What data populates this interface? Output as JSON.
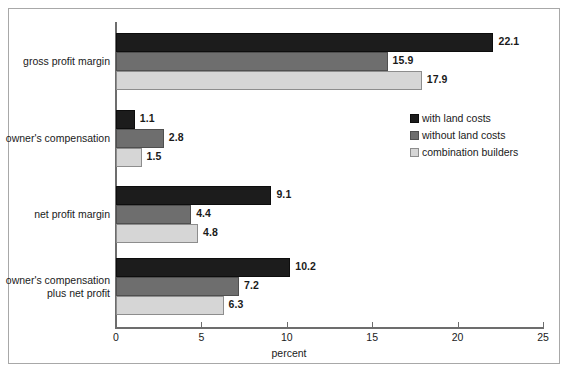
{
  "chart_data": {
    "type": "bar",
    "orientation": "horizontal",
    "title": "",
    "xlabel": "percent",
    "ylabel": "",
    "xlim": [
      0,
      25
    ],
    "xticks": [
      0,
      5,
      10,
      15,
      20,
      25
    ],
    "xtick_labels": [
      "0",
      "5",
      "10",
      "15",
      "20",
      "25"
    ],
    "grid": false,
    "legend_position": "inside-upper-right",
    "categories": [
      "gross profit margin",
      "owner's compensation",
      "net profit margin",
      "owner's compensation\nplus net profit"
    ],
    "series": [
      {
        "name": "with land costs",
        "color": "#1c1c1c",
        "values": [
          22.1,
          1.1,
          9.1,
          10.2
        ],
        "labels": [
          "22.1",
          "1.1",
          "9.1",
          "10.2"
        ]
      },
      {
        "name": "without land costs",
        "color": "#6e6e6e",
        "values": [
          15.9,
          2.8,
          4.4,
          7.2
        ],
        "labels": [
          "15.9",
          "2.8",
          "4.4",
          "7.2"
        ]
      },
      {
        "name": "combination builders",
        "color": "#d6d6d6",
        "values": [
          17.9,
          1.5,
          4.8,
          6.3
        ],
        "labels": [
          "17.9",
          "1.5",
          "4.8",
          "6.3"
        ]
      }
    ]
  },
  "axis": {
    "x_title": "percent",
    "ticks": [
      {
        "value": "0"
      },
      {
        "value": "5"
      },
      {
        "value": "10"
      },
      {
        "value": "15"
      },
      {
        "value": "20"
      },
      {
        "value": "25"
      }
    ]
  },
  "legend": {
    "items": [
      {
        "label": "with land costs",
        "color": "#1c1c1c"
      },
      {
        "label": "without land costs",
        "color": "#6e6e6e"
      },
      {
        "label": "combination builders",
        "color": "#d6d6d6"
      }
    ]
  },
  "categories": [
    {
      "label": "gross profit margin"
    },
    {
      "label": "owner's compensation"
    },
    {
      "label": "net profit margin"
    },
    {
      "label": "owner's compensation\nplus net profit"
    }
  ]
}
